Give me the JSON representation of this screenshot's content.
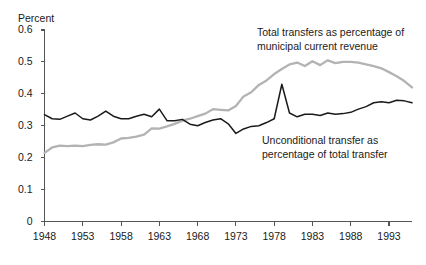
{
  "chart_data": {
    "type": "line",
    "title": "",
    "ylabel": "Percent",
    "xlabel": "",
    "ylim": [
      0,
      0.6
    ],
    "xlim": [
      1948,
      1996
    ],
    "grid": false,
    "legend_position": "inline-annotations",
    "yticks": [
      "0",
      "0.1",
      "0.2",
      "0.3",
      "0.4",
      "0.5",
      "0.6"
    ],
    "ytick_values": [
      0,
      0.1,
      0.2,
      0.3,
      0.4,
      0.5,
      0.6
    ],
    "xticks": [
      "1948",
      "1953",
      "1958",
      "1963",
      "1968",
      "1973",
      "1978",
      "1983",
      "1988",
      "1993"
    ],
    "xtick_values": [
      1948,
      1953,
      1958,
      1963,
      1968,
      1973,
      1978,
      1983,
      1988,
      1993
    ],
    "x": [
      1948,
      1949,
      1950,
      1951,
      1952,
      1953,
      1954,
      1955,
      1956,
      1957,
      1958,
      1959,
      1960,
      1961,
      1962,
      1963,
      1964,
      1965,
      1966,
      1967,
      1968,
      1969,
      1970,
      1971,
      1972,
      1973,
      1974,
      1975,
      1976,
      1977,
      1978,
      1979,
      1980,
      1981,
      1982,
      1983,
      1984,
      1985,
      1986,
      1987,
      1988,
      1989,
      1990,
      1991,
      1992,
      1993,
      1994,
      1995,
      1996
    ],
    "series": [
      {
        "name": "Total transfers as percentage of municipal current revenue",
        "color": "#b3b3b3",
        "values": [
          0.215,
          0.232,
          0.238,
          0.236,
          0.238,
          0.236,
          0.24,
          0.242,
          0.241,
          0.248,
          0.26,
          0.262,
          0.266,
          0.272,
          0.292,
          0.291,
          0.298,
          0.306,
          0.316,
          0.322,
          0.33,
          0.338,
          0.352,
          0.35,
          0.348,
          0.362,
          0.392,
          0.405,
          0.428,
          0.442,
          0.462,
          0.478,
          0.492,
          0.498,
          0.487,
          0.502,
          0.49,
          0.505,
          0.496,
          0.5,
          0.5,
          0.498,
          0.492,
          0.487,
          0.48,
          0.468,
          0.455,
          0.44,
          0.42
        ]
      },
      {
        "name": "Unconditional transfer as percentage of total transfer",
        "color": "#1a1a1a",
        "values": [
          0.335,
          0.322,
          0.32,
          0.33,
          0.34,
          0.322,
          0.318,
          0.33,
          0.346,
          0.33,
          0.322,
          0.322,
          0.33,
          0.336,
          0.328,
          0.352,
          0.316,
          0.316,
          0.32,
          0.305,
          0.3,
          0.31,
          0.318,
          0.322,
          0.306,
          0.276,
          0.29,
          0.298,
          0.3,
          0.31,
          0.322,
          0.43,
          0.34,
          0.328,
          0.336,
          0.336,
          0.332,
          0.34,
          0.336,
          0.338,
          0.342,
          0.352,
          0.36,
          0.372,
          0.375,
          0.372,
          0.38,
          0.378,
          0.372
        ]
      }
    ],
    "annotations": [
      {
        "id": "total-transfers",
        "lines": [
          "Total transfers as percentage of",
          "municipal current revenue"
        ]
      },
      {
        "id": "unconditional-transfer",
        "lines": [
          "Unconditional transfer as",
          "percentage of total transfer"
        ]
      }
    ],
    "axis_color": "#555555",
    "background": "#ffffff"
  }
}
